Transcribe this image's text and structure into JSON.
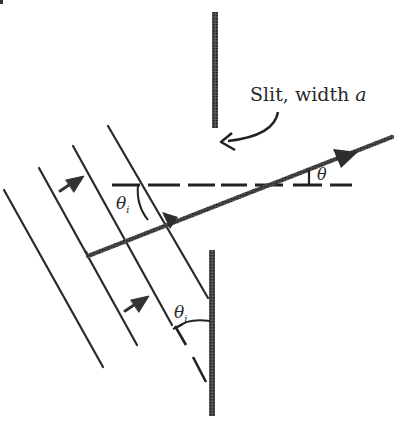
{
  "diagram": {
    "type": "single-slit diffraction geometry",
    "labels": {
      "slit": "Slit, width ",
      "slit_var": "a",
      "theta": "θ",
      "theta_i_main": "θ",
      "theta_i_sub": "i",
      "theta_i2_main": "θ",
      "theta_i2_sub": "i"
    },
    "colors": {
      "ink": "#2a2a2a",
      "barrier": "#3a3a3a",
      "background": "#ffffff"
    }
  }
}
